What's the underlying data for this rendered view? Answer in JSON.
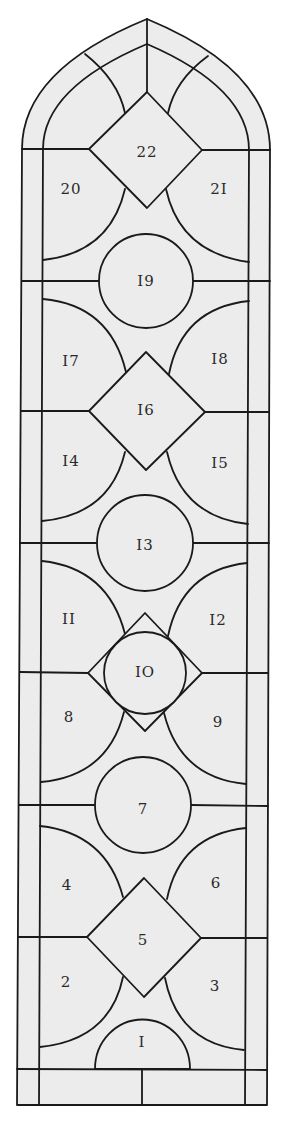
{
  "diagram": {
    "colors": {
      "glass": "#ececec",
      "lead": "#1a1a1a",
      "label": "#2a2a2a",
      "background": "#ffffff"
    },
    "panels": [
      {
        "id": "1",
        "label": "I",
        "x": 142,
        "y": 1043
      },
      {
        "id": "2",
        "label": "2",
        "x": 66,
        "y": 983
      },
      {
        "id": "3",
        "label": "3",
        "x": 215,
        "y": 987
      },
      {
        "id": "4",
        "label": "4",
        "x": 67,
        "y": 886
      },
      {
        "id": "5",
        "label": "5",
        "x": 143,
        "y": 941
      },
      {
        "id": "6",
        "label": "6",
        "x": 216,
        "y": 884
      },
      {
        "id": "7",
        "label": "7",
        "x": 143,
        "y": 810
      },
      {
        "id": "8",
        "label": "8",
        "x": 69,
        "y": 718
      },
      {
        "id": "9",
        "label": "9",
        "x": 218,
        "y": 723
      },
      {
        "id": "10",
        "label": "IO",
        "x": 145,
        "y": 673
      },
      {
        "id": "11",
        "label": "II",
        "x": 69,
        "y": 620
      },
      {
        "id": "12",
        "label": "I2",
        "x": 218,
        "y": 621
      },
      {
        "id": "13",
        "label": "I3",
        "x": 145,
        "y": 546
      },
      {
        "id": "14",
        "label": "I4",
        "x": 71,
        "y": 462
      },
      {
        "id": "15",
        "label": "I5",
        "x": 220,
        "y": 464
      },
      {
        "id": "16",
        "label": "I6",
        "x": 146,
        "y": 411
      },
      {
        "id": "17",
        "label": "I7",
        "x": 71,
        "y": 362
      },
      {
        "id": "18",
        "label": "I8",
        "x": 220,
        "y": 360
      },
      {
        "id": "19",
        "label": "I9",
        "x": 146,
        "y": 282
      },
      {
        "id": "20",
        "label": "20",
        "x": 71,
        "y": 190
      },
      {
        "id": "21",
        "label": "2I",
        "x": 219,
        "y": 190
      },
      {
        "id": "22",
        "label": "22",
        "x": 147,
        "y": 153
      }
    ]
  }
}
